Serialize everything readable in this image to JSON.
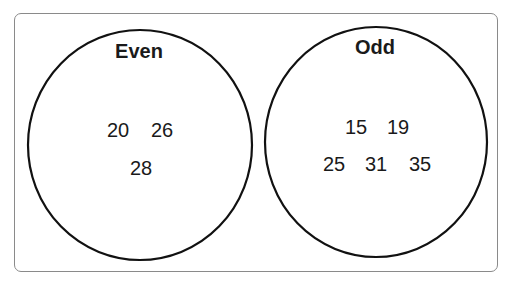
{
  "diagram": {
    "type": "venn-separate-sets",
    "sets": [
      {
        "label": "Even",
        "values": [
          "20",
          "26",
          "28"
        ]
      },
      {
        "label": "Odd",
        "values": [
          "15",
          "19",
          "25",
          "31",
          "35"
        ]
      }
    ]
  }
}
